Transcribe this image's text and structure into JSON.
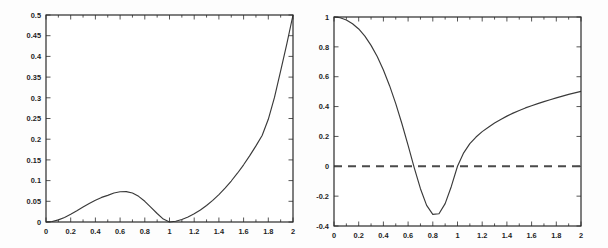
{
  "figure": {
    "background_color": "#fdfdfd",
    "axis_color": "#2b2b2b",
    "curve_color": "#3a3a3a",
    "dash_color": "#4a4a4a"
  },
  "chart_data": [
    {
      "type": "line",
      "id": "left-plot",
      "title": "",
      "xlabel": "",
      "ylabel": "",
      "xlim": [
        0,
        2
      ],
      "ylim": [
        0,
        0.5
      ],
      "grid": false,
      "legend": null,
      "xticks": [
        0,
        0.2,
        0.4,
        0.6,
        0.8,
        1,
        1.2,
        1.4,
        1.6,
        1.8,
        2
      ],
      "xticklabels": [
        "0",
        "0.2",
        "0.4",
        "0.6",
        "0.8",
        "1",
        "1.2",
        "1.4",
        "1.6",
        "1.8",
        "2"
      ],
      "yticks": [
        0,
        0.05,
        0.1,
        0.15,
        0.2,
        0.25,
        0.3,
        0.35,
        0.4,
        0.45,
        0.5
      ],
      "yticklabels": [
        "0",
        "0.05",
        "0.1",
        "0.15",
        "0.2",
        "0.25",
        "0.3",
        "0.35",
        "0.4",
        "0.45",
        "0.5"
      ],
      "series": [
        {
          "name": "curve",
          "style": "solid",
          "x": [
            0,
            0.05,
            0.1,
            0.15,
            0.2,
            0.25,
            0.3,
            0.35,
            0.4,
            0.45,
            0.5,
            0.55,
            0.6,
            0.65,
            0.7,
            0.75,
            0.8,
            0.85,
            0.9,
            0.95,
            1.0,
            1.05,
            1.1,
            1.15,
            1.2,
            1.25,
            1.3,
            1.35,
            1.4,
            1.45,
            1.5,
            1.55,
            1.6,
            1.65,
            1.7,
            1.75,
            1.8,
            1.85,
            1.9,
            1.95,
            2.0
          ],
          "y": [
            0,
            0.0013,
            0.0051,
            0.011,
            0.0185,
            0.027,
            0.036,
            0.0447,
            0.0527,
            0.0594,
            0.0644,
            0.07,
            0.073,
            0.0735,
            0.07,
            0.062,
            0.05,
            0.0355,
            0.0205,
            0.007,
            0.0,
            0.0018,
            0.0061,
            0.0122,
            0.0198,
            0.029,
            0.0398,
            0.0522,
            0.0662,
            0.0818,
            0.099,
            0.1178,
            0.1382,
            0.1602,
            0.1838,
            0.209,
            0.248,
            0.301,
            0.365,
            0.43,
            0.5
          ]
        }
      ]
    },
    {
      "type": "line",
      "id": "right-plot",
      "title": "",
      "xlabel": "",
      "ylabel": "",
      "xlim": [
        0,
        2
      ],
      "ylim": [
        -0.4,
        1
      ],
      "grid": false,
      "legend": null,
      "xticks": [
        0,
        0.2,
        0.4,
        0.6,
        0.8,
        1,
        1.2,
        1.4,
        1.6,
        1.8,
        2
      ],
      "xticklabels": [
        "0",
        "0.2",
        "0.4",
        "0.6",
        "0.8",
        "1",
        "1.2",
        "1.4",
        "1.6",
        "1.8",
        "2"
      ],
      "yticks": [
        -0.4,
        -0.2,
        0,
        0.2,
        0.4,
        0.6,
        0.8,
        1
      ],
      "yticklabels": [
        "-0.4",
        "-0.2",
        "0",
        "0.2",
        "0.4",
        "0.6",
        "0.8",
        "1"
      ],
      "series": [
        {
          "name": "curve",
          "style": "solid",
          "x": [
            0,
            0.05,
            0.1,
            0.15,
            0.2,
            0.25,
            0.3,
            0.35,
            0.4,
            0.45,
            0.5,
            0.55,
            0.6,
            0.65,
            0.7,
            0.75,
            0.8,
            0.85,
            0.9,
            0.95,
            1.0,
            1.05,
            1.1,
            1.15,
            1.2,
            1.25,
            1.3,
            1.35,
            1.4,
            1.45,
            1.5,
            1.55,
            1.6,
            1.65,
            1.7,
            1.75,
            1.8,
            1.85,
            1.9,
            1.95,
            2.0
          ],
          "y": [
            1.0,
            0.995,
            0.98,
            0.955,
            0.92,
            0.872,
            0.81,
            0.735,
            0.645,
            0.54,
            0.42,
            0.285,
            0.14,
            -0.01,
            -0.15,
            -0.262,
            -0.322,
            -0.318,
            -0.25,
            -0.135,
            0.0,
            0.09,
            0.152,
            0.196,
            0.232,
            0.262,
            0.29,
            0.314,
            0.336,
            0.356,
            0.374,
            0.391,
            0.406,
            0.42,
            0.433,
            0.446,
            0.458,
            0.47,
            0.482,
            0.492,
            0.502
          ]
        },
        {
          "name": "zero-line",
          "style": "dashed",
          "x": [
            0,
            2
          ],
          "y": [
            0,
            0
          ]
        }
      ]
    }
  ]
}
